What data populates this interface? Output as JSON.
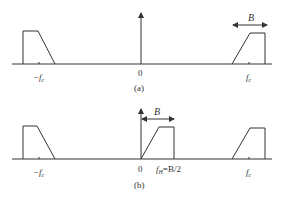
{
  "panels": [
    {
      "id": "a",
      "caption": "(a)",
      "labels": {
        "neg_fc": "−f",
        "neg_fc_sub": "c",
        "zero": "0",
        "fc": "f",
        "fc_sub": "c",
        "bandwidth": "B"
      }
    },
    {
      "id": "b",
      "caption": "(b)",
      "labels": {
        "neg_fc": "−f",
        "neg_fc_sub": "c",
        "zero": "0",
        "fh": "f",
        "fh_sub": "H",
        "fh_eq": "=B/2",
        "fc": "f",
        "fc_sub": "c",
        "bandwidth": "B"
      }
    }
  ],
  "colors": {
    "stroke": "#333333",
    "background": "#ffffff"
  }
}
